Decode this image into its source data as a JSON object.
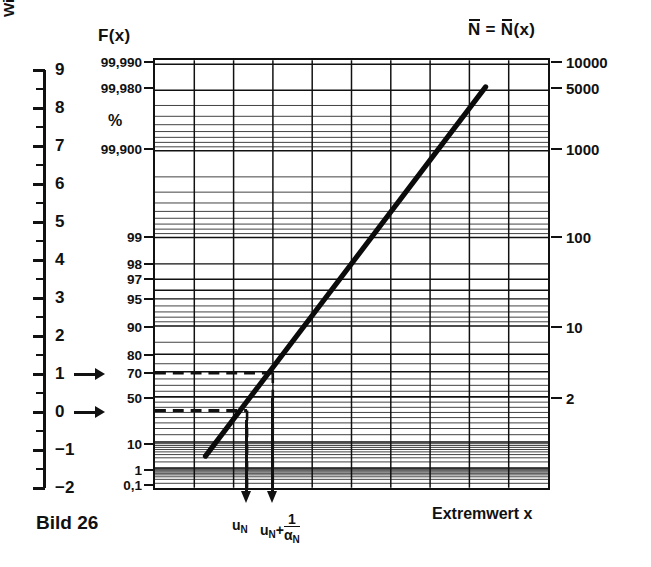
{
  "figure": {
    "caption": "Bild 26",
    "x_axis_title": "Extremwert x",
    "y_axis_left_title": "reduzierter Extremwert y",
    "y_axis_right_title": "Wiederkehrperiode",
    "top_left_header": "F(x)",
    "top_right_header_parts": {
      "n1": "N",
      "eq": " = ",
      "n2": "N",
      "arg": "(x)"
    },
    "percent_symbol": "%"
  },
  "annotations": {
    "u_n": {
      "base": "u",
      "sub": "N"
    },
    "u_n_plus": {
      "base": "u",
      "sub": "N",
      "plus": "+",
      "num": "1",
      "den_base": "α",
      "den_sub": "N"
    },
    "arrow_y1_value": "1",
    "arrow_y0_value": "0"
  },
  "chart_data": {
    "type": "line",
    "title": "Bild 26",
    "xlabel": "Extremwert x",
    "ylabel": "reduzierter Extremwert y",
    "grid": true,
    "legend": null,
    "y_reduced": {
      "label": "reduzierter Extremwert y",
      "ylim": [
        -2,
        9
      ],
      "major_ticks": [
        9,
        8,
        7,
        6,
        5,
        4,
        3,
        2,
        1,
        0,
        -1,
        -2
      ],
      "minor_tick_step": 0.5
    },
    "probability_axis": {
      "label": "F(x)",
      "unit": "%",
      "tick_labels": [
        "99,990",
        "99,980",
        "99,900",
        "99",
        "98",
        "97",
        "95",
        "90",
        "80",
        "70",
        "50",
        "10",
        "1",
        "0,1"
      ],
      "tick_values_percent": [
        99.99,
        99.98,
        99.9,
        99,
        98,
        97,
        95,
        90,
        80,
        70,
        50,
        10,
        1,
        0.1
      ],
      "tick_reduced_y": [
        9.21,
        8.52,
        6.91,
        4.6,
        3.9,
        3.49,
        2.97,
        2.25,
        1.5,
        1.03,
        0.367,
        -0.834,
        -1.527,
        -1.933
      ]
    },
    "return_period_axis": {
      "label": "Wiederkehrperiode",
      "header": "N = N(x)",
      "tick_labels": [
        "10000",
        "5000",
        "1000",
        "100",
        "10",
        "2"
      ],
      "tick_values": [
        10000,
        5000,
        1000,
        100,
        10,
        2
      ],
      "tick_reduced_y": [
        9.21,
        8.52,
        6.91,
        4.6,
        2.25,
        0.367
      ]
    },
    "series": [
      {
        "name": "Gumbel fit line",
        "style": "solid-thick",
        "points_px": [
          [
            204,
            458
          ],
          [
            487,
            85
          ]
        ],
        "y_start": -1.66,
        "y_end": 8.44
      }
    ],
    "construction_lines": [
      {
        "name": "dashed-y1",
        "orientation": "horizontal",
        "y_reduced": 1.0,
        "from_x_px": 153,
        "to_x_px": 272
      },
      {
        "name": "dashed-y0",
        "orientation": "horizontal",
        "y_reduced": 0.0,
        "from_x_px": 153,
        "to_x_px": 246
      },
      {
        "name": "drop-u-n",
        "orientation": "vertical",
        "x_px": 246,
        "to_axis": true
      },
      {
        "name": "drop-u-n-plus",
        "orientation": "vertical",
        "x_px": 272,
        "to_axis": true
      }
    ],
    "grid_vertical_count": 9,
    "x_axis_ticks_unlabeled": true
  }
}
